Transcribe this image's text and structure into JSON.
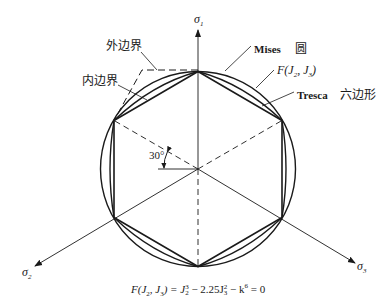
{
  "diagram": {
    "type": "yield-surface-pi-plane",
    "axes": {
      "sigma1": {
        "label": "σ",
        "sub": "1"
      },
      "sigma2": {
        "label": "σ",
        "sub": "2"
      },
      "sigma3": {
        "label": "σ",
        "sub": "3"
      }
    },
    "labels": {
      "outer_boundary": "外边界",
      "inner_boundary": "内边界",
      "mises_latin": "Mises",
      "mises_cn": "圆",
      "f_curve": {
        "F": "F(J",
        "sub1": "2",
        "mid": ", J",
        "sub2": "3",
        "end": ")"
      },
      "tresca_latin": "Tresca",
      "tresca_cn": "六边形",
      "angle": "30°"
    },
    "formula": {
      "lhs": "F(J",
      "lhs_sub1": "2",
      "lhs_mid": ", J",
      "lhs_sub2": "3",
      "lhs_end": ") = J",
      "t1_sub": "2",
      "t1_sup": "3",
      "op1": " − 2.25J",
      "t2_sub": "3",
      "t2_sup": "2",
      "op2": " − k",
      "t3_sup": "6",
      "rhs": " = 0"
    },
    "colors": {
      "stroke": "#1a1a1a",
      "background": "#ffffff"
    }
  }
}
